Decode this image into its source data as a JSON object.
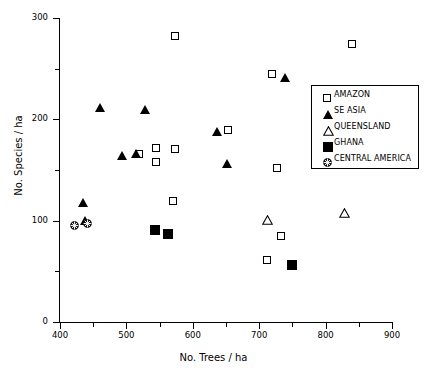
{
  "chart_data": {
    "type": "scatter",
    "title": "",
    "xlabel": "No. Trees / ha",
    "ylabel": "No. Species / ha",
    "xlim": [
      400,
      900
    ],
    "ylim": [
      0,
      300
    ],
    "xticks": [
      400,
      500,
      600,
      700,
      800,
      900
    ],
    "yticks": [
      0,
      100,
      200,
      300
    ],
    "x_minor_ticks": [
      450,
      550,
      650,
      750,
      850
    ],
    "y_minor_ticks": [
      50,
      150,
      250
    ],
    "grid": false,
    "legend_position": "right",
    "series": [
      {
        "name": "AMAZON",
        "marker": "open-square",
        "points": [
          [
            573,
            282
          ],
          [
            840,
            274
          ],
          [
            720,
            245
          ],
          [
            653,
            189
          ],
          [
            545,
            172
          ],
          [
            573,
            171
          ],
          [
            519,
            166
          ],
          [
            545,
            158
          ],
          [
            727,
            152
          ],
          [
            570,
            119
          ],
          [
            733,
            85
          ],
          [
            712,
            61
          ]
        ]
      },
      {
        "name": "SE ASIA",
        "marker": "filled-triangle",
        "points": [
          [
            739,
            241
          ],
          [
            460,
            212
          ],
          [
            528,
            210
          ],
          [
            636,
            188
          ],
          [
            494,
            164
          ],
          [
            514,
            166
          ],
          [
            651,
            156
          ],
          [
            434,
            118
          ],
          [
            437,
            100
          ]
        ]
      },
      {
        "name": "QUEENSLAND",
        "marker": "open-triangle",
        "points": [
          [
            828,
            108
          ],
          [
            713,
            101
          ]
        ]
      },
      {
        "name": "GHANA",
        "marker": "filled-square",
        "points": [
          [
            542,
            92
          ],
          [
            561,
            88
          ],
          [
            748,
            57
          ]
        ]
      },
      {
        "name": "CENTRAL AMERICA",
        "marker": "circle-cross",
        "points": [
          [
            422,
            95
          ],
          [
            441,
            97
          ]
        ]
      }
    ]
  },
  "axes": {
    "x_title": "No. Trees / ha",
    "y_title": "No. Species / ha",
    "x_tick_labels": [
      "400",
      "500",
      "600",
      "700",
      "800",
      "900"
    ],
    "y_tick_labels": [
      "0",
      "100",
      "200",
      "300"
    ]
  },
  "legend": {
    "items": [
      {
        "label": "AMAZON",
        "marker": "open-square"
      },
      {
        "label": "SE ASIA",
        "marker": "filled-triangle"
      },
      {
        "label": "QUEENSLAND",
        "marker": "open-triangle"
      },
      {
        "label": "GHANA",
        "marker": "filled-square"
      },
      {
        "label": "CENTRAL AMERICA",
        "marker": "circle-cross"
      }
    ]
  },
  "colors": {
    "foreground": "#000000",
    "background": "#ffffff"
  }
}
